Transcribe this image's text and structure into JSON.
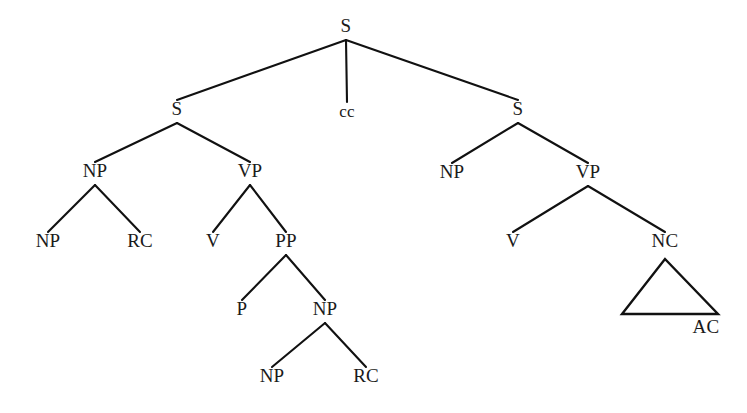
{
  "figure": {
    "type": "constituency-parse-tree",
    "background_color": "#ffffff",
    "line_color": "#111111",
    "text_color": "#1a1a1a"
  },
  "chart_data": {
    "type": "tree",
    "title": "",
    "nodes": [
      {
        "id": "S0",
        "label": "S",
        "x": 346,
        "y": 32,
        "parent": null
      },
      {
        "id": "S1",
        "label": "S",
        "x": 177,
        "y": 115,
        "parent": "S0"
      },
      {
        "id": "CC",
        "label": "cc",
        "x": 347,
        "y": 117,
        "parent": "S0"
      },
      {
        "id": "S2",
        "label": "S",
        "x": 518,
        "y": 115,
        "parent": "S0"
      },
      {
        "id": "NP1",
        "label": "NP",
        "x": 95,
        "y": 177,
        "parent": "S1"
      },
      {
        "id": "VP1",
        "label": "VP",
        "x": 250,
        "y": 177,
        "parent": "S1"
      },
      {
        "id": "NP2",
        "label": "NP",
        "x": 48,
        "y": 247,
        "parent": "NP1"
      },
      {
        "id": "RC1",
        "label": "RC",
        "x": 140,
        "y": 247,
        "parent": "NP1"
      },
      {
        "id": "V1",
        "label": "V",
        "x": 213,
        "y": 247,
        "parent": "VP1"
      },
      {
        "id": "PP1",
        "label": "PP",
        "x": 286,
        "y": 247,
        "parent": "VP1"
      },
      {
        "id": "P1",
        "label": "P",
        "x": 242,
        "y": 315,
        "parent": "PP1"
      },
      {
        "id": "NP3",
        "label": "NP",
        "x": 325,
        "y": 315,
        "parent": "PP1"
      },
      {
        "id": "NP4",
        "label": "NP",
        "x": 272,
        "y": 382,
        "parent": "NP3"
      },
      {
        "id": "RC2",
        "label": "RC",
        "x": 366,
        "y": 382,
        "parent": "NP3"
      },
      {
        "id": "NP5",
        "label": "NP",
        "x": 452,
        "y": 178,
        "parent": "S2"
      },
      {
        "id": "VP2",
        "label": "VP",
        "x": 588,
        "y": 178,
        "parent": "S2"
      },
      {
        "id": "V2",
        "label": "V",
        "x": 513,
        "y": 247,
        "parent": "VP2"
      },
      {
        "id": "NC1",
        "label": "NC",
        "x": 665,
        "y": 247,
        "parent": "VP2"
      },
      {
        "id": "AC1",
        "label": "AC",
        "x": 706,
        "y": 333,
        "parent": null
      }
    ],
    "edges": [
      {
        "from": "S0",
        "to": "S1"
      },
      {
        "from": "S0",
        "to": "CC"
      },
      {
        "from": "S0",
        "to": "S2"
      },
      {
        "from": "S1",
        "to": "NP1"
      },
      {
        "from": "S1",
        "to": "VP1"
      },
      {
        "from": "NP1",
        "to": "NP2"
      },
      {
        "from": "NP1",
        "to": "RC1"
      },
      {
        "from": "VP1",
        "to": "V1"
      },
      {
        "from": "VP1",
        "to": "PP1"
      },
      {
        "from": "PP1",
        "to": "P1"
      },
      {
        "from": "PP1",
        "to": "NP3"
      },
      {
        "from": "NP3",
        "to": "NP4"
      },
      {
        "from": "NP3",
        "to": "RC2"
      },
      {
        "from": "S2",
        "to": "NP5"
      },
      {
        "from": "S2",
        "to": "VP2"
      },
      {
        "from": "VP2",
        "to": "V2"
      },
      {
        "from": "VP2",
        "to": "NC1"
      }
    ],
    "triangles": [
      {
        "id": "TRI1",
        "under": "NC1",
        "apex_x": 665,
        "apex_y": 259,
        "base_left_x": 622,
        "base_right_x": 718,
        "base_y": 314,
        "leaf_label": "AC"
      }
    ],
    "node_labels": [
      "S",
      "S",
      "cc",
      "S",
      "NP",
      "VP",
      "NP",
      "RC",
      "V",
      "PP",
      "P",
      "NP",
      "NP",
      "RC",
      "NP",
      "VP",
      "V",
      "NC",
      "AC"
    ],
    "legend": []
  }
}
